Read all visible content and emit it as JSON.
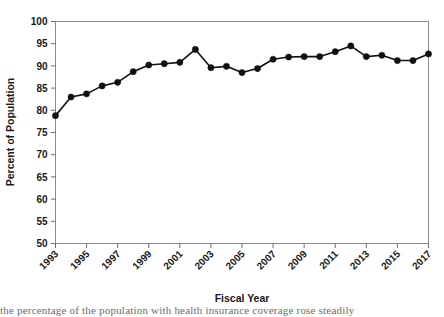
{
  "chart_data": {
    "type": "line",
    "title": "",
    "xlabel": "Fiscal Year",
    "ylabel": "Percent of Population",
    "ylim": [
      50,
      100
    ],
    "xlim": [
      1993,
      2017
    ],
    "grid": false,
    "legend": null,
    "y_ticks": [
      50,
      55,
      60,
      65,
      70,
      75,
      80,
      85,
      90,
      95,
      100
    ],
    "x_ticks": [
      1993,
      1995,
      1997,
      1999,
      2001,
      2003,
      2005,
      2007,
      2009,
      2011,
      2013,
      2015,
      2017
    ],
    "x": [
      1993,
      1994,
      1995,
      1996,
      1997,
      1998,
      1999,
      2000,
      2001,
      2002,
      2003,
      2004,
      2005,
      2006,
      2007,
      2008,
      2009,
      2010,
      2011,
      2012,
      2013,
      2014,
      2015,
      2016,
      2017
    ],
    "values": [
      78.8,
      83.0,
      83.7,
      85.5,
      86.3,
      88.7,
      90.2,
      90.5,
      90.8,
      93.7,
      89.6,
      89.9,
      88.5,
      89.4,
      91.5,
      92.0,
      92.1,
      92.1,
      93.2,
      94.5,
      92.1,
      92.4,
      91.2,
      91.2,
      92.7
    ],
    "series": [
      {
        "name": "Percent of Population",
        "values": [
          78.8,
          83.0,
          83.7,
          85.5,
          86.3,
          88.7,
          90.2,
          90.5,
          90.8,
          93.7,
          89.6,
          89.9,
          88.5,
          89.4,
          91.5,
          92.0,
          92.1,
          92.1,
          93.2,
          94.5,
          92.1,
          92.4,
          91.2,
          91.2,
          92.7
        ]
      }
    ],
    "marker": "filled-circle",
    "line_color": "#111111",
    "marker_color": "#111111"
  },
  "figure": {
    "caption_fragment": "the percentage of the population with health insurance coverage rose steadily"
  }
}
